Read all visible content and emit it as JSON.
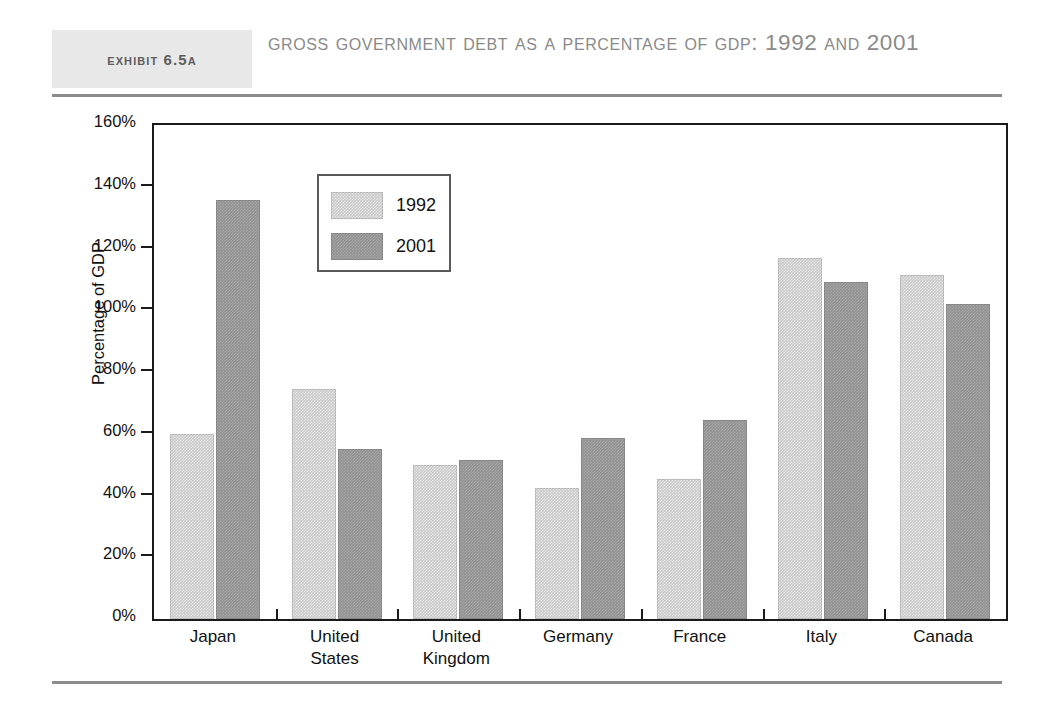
{
  "header": {
    "badge_label": "Exhibit 6.5A",
    "title": "Gross Government Debt as a Percentage of GDP: 1992 and 2001"
  },
  "chart_data": {
    "type": "bar",
    "title": "Gross Government Debt as a Percentage of GDP: 1992 and 2001",
    "xlabel": "",
    "ylabel": "Percentage of GDP",
    "ylim": [
      0,
      160
    ],
    "ytick_step": 20,
    "ytick_labels": [
      "0%",
      "20%",
      "40%",
      "60%",
      "80%",
      "100%",
      "120%",
      "140%",
      "160%"
    ],
    "ytick_values": [
      0,
      20,
      40,
      60,
      80,
      100,
      120,
      140,
      160
    ],
    "grid": false,
    "legend_position": "upper-left-inside",
    "categories": [
      "Japan",
      "United\nStates",
      "United\nKingdom",
      "Germany",
      "France",
      "Italy",
      "Canada"
    ],
    "series": [
      {
        "name": "1992",
        "color": "#c8c8c8",
        "values": [
          59.8,
          74.5,
          49.8,
          42.5,
          45.2,
          117.0,
          111.4
        ]
      },
      {
        "name": "2001",
        "color": "#919191",
        "values": [
          135.7,
          55.0,
          51.4,
          58.5,
          64.6,
          109.3,
          101.9
        ]
      }
    ]
  }
}
